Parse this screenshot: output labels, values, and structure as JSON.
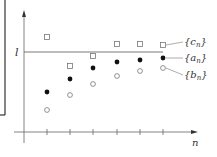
{
  "chart_data": {
    "type": "scatter",
    "title": "",
    "xlabel": "n",
    "ylabel": "",
    "limit_label": "l",
    "limit_y_px": 52,
    "x_ticks_px": [
      47,
      70,
      93,
      117,
      140,
      163
    ],
    "series": [
      {
        "name": "{c_n}",
        "marker": "open-square",
        "label": "{c",
        "sub": "n",
        "label_y": 45,
        "points": [
          [
            47,
            37
          ],
          [
            70,
            66
          ],
          [
            93,
            56
          ],
          [
            117,
            44
          ],
          [
            140,
            44
          ],
          [
            163,
            45
          ]
        ]
      },
      {
        "name": "{a_n}",
        "marker": "filled-circle",
        "label": "{a",
        "sub": "n",
        "label_y": 61,
        "points": [
          [
            47,
            92
          ],
          [
            70,
            79
          ],
          [
            93,
            68
          ],
          [
            117,
            62
          ],
          [
            140,
            60
          ],
          [
            163,
            58
          ]
        ]
      },
      {
        "name": "{b_n}",
        "marker": "open-circle",
        "label": "{b",
        "sub": "n",
        "label_y": 78,
        "points": [
          [
            47,
            110
          ],
          [
            70,
            95
          ],
          [
            93,
            84
          ],
          [
            117,
            76
          ],
          [
            140,
            71
          ],
          [
            163,
            68
          ]
        ]
      }
    ]
  },
  "colors": {
    "axis": "#555555",
    "marker": "#222222",
    "open_marker": "#777777",
    "frame": "#333333"
  }
}
